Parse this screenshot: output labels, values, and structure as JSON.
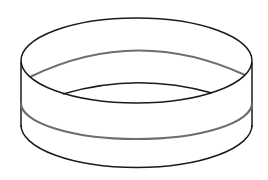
{
  "figure": {
    "colors": {
      "background": "#ffffff",
      "outline": "#1a1a1a",
      "band": "#6e6e6e"
    }
  }
}
